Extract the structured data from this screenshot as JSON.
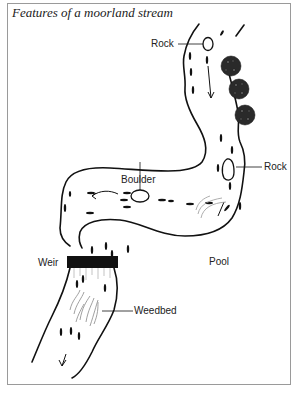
{
  "figure": {
    "title": "Features of a moorland stream",
    "labels": {
      "rock_top": "Rock",
      "rock_right": "Rock",
      "boulder": "Boulder",
      "pool": "Pool",
      "weir": "Weir",
      "weedbed": "Weedbed"
    }
  }
}
